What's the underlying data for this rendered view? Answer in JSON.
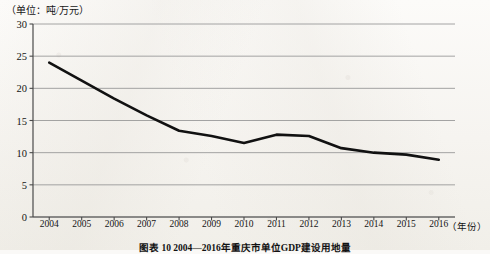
{
  "unit_label": "（单位：吨/万元）",
  "x_axis_title": "（年份）",
  "caption": "图表 10  2004—2016年重庆市单位GDP建设用地量",
  "colors": {
    "line": "#111111",
    "grid": "#9a9a9a",
    "axis": "#4a4a4a",
    "paper": "#f6f4f0",
    "text": "#141414"
  },
  "chart_data": {
    "type": "line",
    "title": "图表 10  2004—2016年重庆市单位GDP建设用地量",
    "xlabel": "（年份）",
    "ylabel": "（单位：吨/万元）",
    "ylim": [
      0,
      30
    ],
    "yticks": [
      0,
      5,
      10,
      15,
      20,
      25,
      30
    ],
    "ytick_labels": [
      "0",
      "5",
      "10",
      "15",
      "20",
      "25",
      "30"
    ],
    "grid": true,
    "legend": "none",
    "categories": [
      "2004",
      "2005",
      "2006",
      "2007",
      "2008",
      "2009",
      "2010",
      "2011",
      "2012",
      "2013",
      "2014",
      "2015",
      "2016"
    ],
    "series": [
      {
        "name": "单位GDP建设用地量",
        "values": [
          24.0,
          21.2,
          18.4,
          15.8,
          13.4,
          12.6,
          11.5,
          12.8,
          12.6,
          10.7,
          10.0,
          9.7,
          8.9
        ]
      }
    ]
  }
}
